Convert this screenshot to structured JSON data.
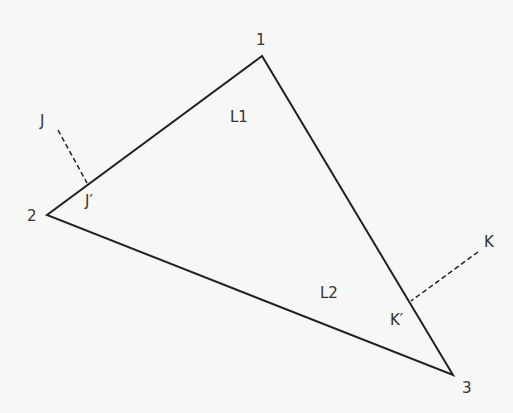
{
  "diagram": {
    "colors": {
      "line": "#222222",
      "text": "#333333",
      "background": "#f7f7f6"
    },
    "vertices": [
      {
        "label": "1",
        "x": 262,
        "y": 56
      },
      {
        "label": "2",
        "x": 47,
        "y": 215
      },
      {
        "label": "3",
        "x": 453,
        "y": 375
      }
    ],
    "regions": [
      {
        "label": "L1",
        "x": 230,
        "y": 117
      },
      {
        "label": "L2",
        "x": 320,
        "y": 295
      }
    ],
    "projections": [
      {
        "point": "J",
        "foot": "J′"
      },
      {
        "point": "K",
        "foot": "K′"
      }
    ]
  }
}
